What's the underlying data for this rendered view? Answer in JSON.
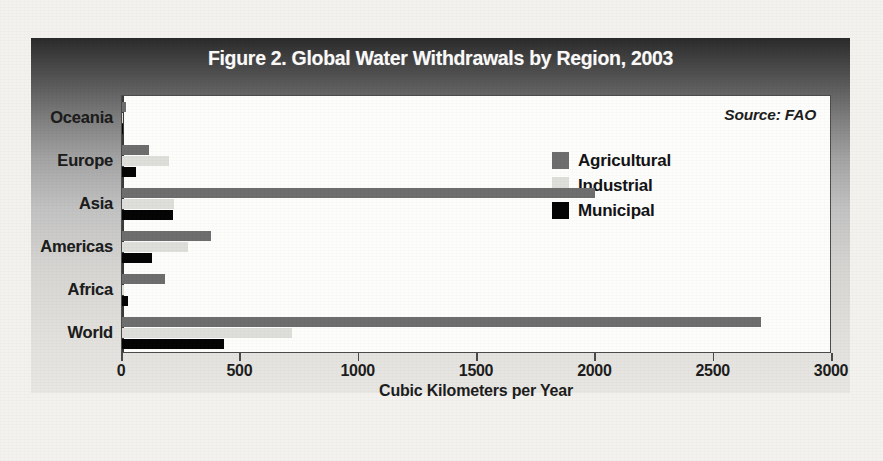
{
  "figure": {
    "title": "Figure 2. Global Water Withdrawals by Region, 2003",
    "source_note": "Source: FAO"
  },
  "legend": {
    "items": [
      {
        "label": "Agricultural",
        "color": "#6e6e6e",
        "key": "agricultural"
      },
      {
        "label": "Industrial",
        "color": "#dededa",
        "key": "industrial"
      },
      {
        "label": "Municipal",
        "color": "#050505",
        "key": "municipal"
      }
    ]
  },
  "axis": {
    "x_title": "Cubic Kilometers per Year",
    "x_ticks": [
      "0",
      "500",
      "1000",
      "1500",
      "2000",
      "2500",
      "3000"
    ]
  },
  "chart_data": {
    "type": "bar",
    "orientation": "horizontal",
    "title": "Figure 2. Global Water Withdrawals by Region, 2003",
    "xlabel": "Cubic Kilometers per Year",
    "ylabel": "",
    "xlim": [
      0,
      3000
    ],
    "xticks": [
      0,
      500,
      1000,
      1500,
      2000,
      2500,
      3000
    ],
    "grid": false,
    "legend_position": "upper-right-inside",
    "annotations": [
      "Source: FAO"
    ],
    "categories": [
      "Oceania",
      "Europe",
      "Asia",
      "Americas",
      "Africa",
      "World"
    ],
    "series": [
      {
        "name": "Agricultural",
        "color": "#6e6e6e",
        "values": [
          18,
          115,
          2000,
          375,
          180,
          2700
        ]
      },
      {
        "name": "Industrial",
        "color": "#dededa",
        "values": [
          3,
          200,
          220,
          280,
          10,
          720
        ]
      },
      {
        "name": "Municipal",
        "color": "#050505",
        "values": [
          5,
          60,
          215,
          125,
          25,
          430
        ]
      }
    ]
  }
}
